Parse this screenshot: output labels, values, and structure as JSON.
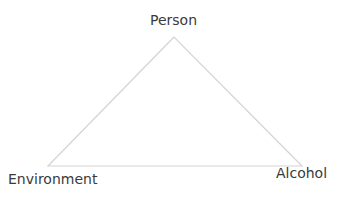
{
  "diagram": {
    "type": "triangle",
    "line_color": "#d4d4d4",
    "text_color": "#3a3a3a",
    "vertices": {
      "top": {
        "label": "Person",
        "x": 174,
        "y": 37
      },
      "bottom_left": {
        "label": "Environment",
        "x": 48,
        "y": 166
      },
      "bottom_right": {
        "label": "Alcohol",
        "x": 302,
        "y": 166
      }
    }
  }
}
